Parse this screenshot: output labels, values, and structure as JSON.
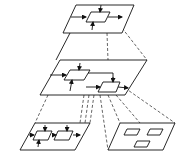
{
  "diagram": {
    "colors": {
      "stroke": "#111111",
      "background": "#ffffff"
    },
    "levels": [
      {
        "name": "top-plane",
        "components": 1
      },
      {
        "name": "middle-plane",
        "components": 2
      },
      {
        "name": "bottom-left-plane",
        "components": 2
      },
      {
        "name": "bottom-right-plane",
        "components": 3
      }
    ]
  }
}
